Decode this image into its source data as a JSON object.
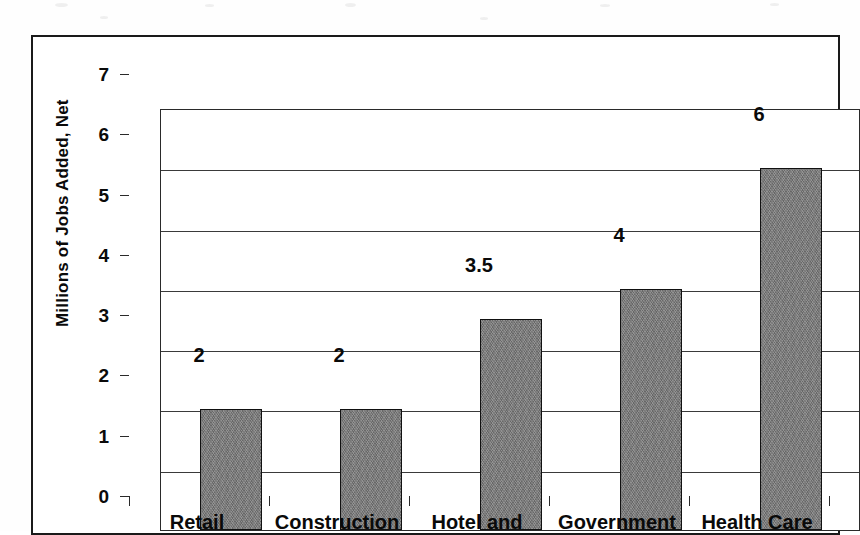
{
  "chart_data": {
    "type": "bar",
    "title": "",
    "xlabel": "",
    "ylabel": "Millions of Jobs Added, Net",
    "ylim": [
      0,
      7
    ],
    "ytick_labels": [
      "0",
      "1",
      "2",
      "3",
      "4",
      "5",
      "6",
      "7"
    ],
    "yticks": [
      0,
      1,
      2,
      3,
      4,
      5,
      6,
      7
    ],
    "grid": true,
    "legend": "none",
    "categories": [
      "Retail",
      "Construction",
      "Hotel and",
      "Government",
      "Health Care"
    ],
    "values": [
      2,
      2,
      3.5,
      4,
      6
    ],
    "value_labels": [
      "2",
      "2",
      "3.5",
      "4",
      "6"
    ],
    "bar_fill_color": "#7d7d7d",
    "bar_edge_color": "#111111",
    "axis_color": "#2a2a2a",
    "background_color": "#ffffff"
  },
  "notes": {
    "x_label_truncated": "Hotel and"
  }
}
